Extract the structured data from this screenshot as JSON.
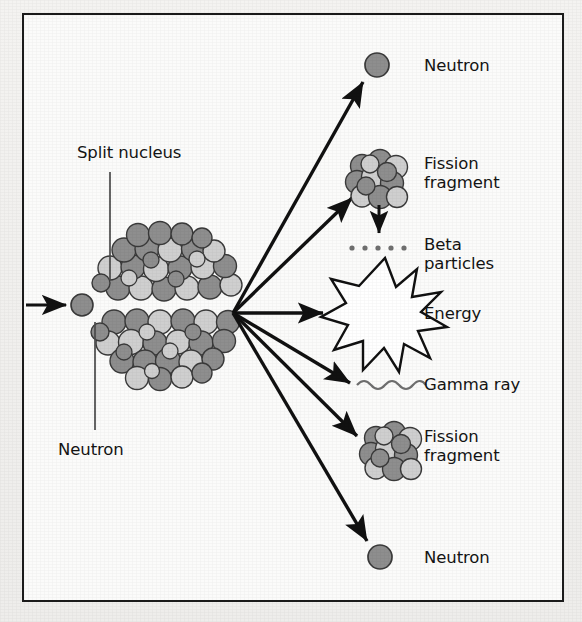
{
  "figure": {
    "cut_off_title_fragment": "gy",
    "frame": {
      "x": 22,
      "y": 13,
      "width": 542,
      "height": 589
    },
    "background_color": "#fbfbfa",
    "border_color": "#1b1b1b",
    "page_color": "#f2f1ef"
  },
  "palette": {
    "nucleon_dark": "#8e8e8e",
    "nucleon_light": "#cfcfcf",
    "nucleon_outline": "#3a3a3a",
    "line": "#111111",
    "text": "#141414"
  },
  "labels": {
    "split_nucleus": "Split nucleus",
    "neutron_in": "Neutron",
    "neutron_top": "Neutron",
    "fission_fragment_top": "Fission\nfragment",
    "beta_particles": "Beta\nparticles",
    "energy": "Energy",
    "gamma_ray": "Gamma ray",
    "fission_fragment_bottom": "Fission\nfragment",
    "neutron_bottom": "Neutron"
  },
  "diagram": {
    "type": "nuclear-fission-schematic",
    "burst_origin": {
      "x": 233,
      "y": 313
    },
    "incoming_neutron": {
      "x": 82,
      "y": 305,
      "r": 11
    },
    "nucleus_top_half": {
      "cx": 168,
      "cy": 270
    },
    "nucleus_bottom_half": {
      "cx": 168,
      "cy": 345
    },
    "products": [
      {
        "name": "neutron-top",
        "icon": "single-circle",
        "x": 377,
        "y": 65
      },
      {
        "name": "fission-fragment-top",
        "icon": "circle-cluster",
        "x": 377,
        "y": 180
      },
      {
        "name": "beta-particles",
        "icon": "dot-row",
        "x": 377,
        "y": 247
      },
      {
        "name": "energy",
        "icon": "starburst",
        "x": 385,
        "y": 315
      },
      {
        "name": "gamma-ray",
        "icon": "wavy-line",
        "x": 385,
        "y": 385
      },
      {
        "name": "fission-fragment-bottom",
        "icon": "circle-cluster",
        "x": 390,
        "y": 452
      },
      {
        "name": "neutron-bottom",
        "icon": "single-circle",
        "x": 380,
        "y": 557
      }
    ],
    "beta_dot_count": 5,
    "starburst_points": 11
  }
}
